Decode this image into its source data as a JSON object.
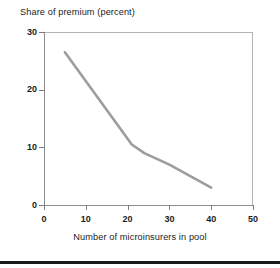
{
  "chart_data": {
    "type": "line",
    "title": "",
    "xlabel": "Number of microinsurers in pool",
    "ylabel": "Share of premium (percent)",
    "xlim": [
      0,
      50
    ],
    "ylim": [
      0,
      30
    ],
    "xticks": [
      0,
      10,
      20,
      30,
      40,
      50
    ],
    "yticks": [
      0,
      10,
      20,
      30
    ],
    "grid": false,
    "legend": null,
    "series": [
      {
        "name": "Share of premium",
        "color": "#9d9d9d",
        "x": [
          5,
          21,
          24,
          30,
          40
        ],
        "values": [
          26.5,
          10.5,
          9.0,
          7.0,
          3.0
        ]
      }
    ]
  },
  "axis": {
    "y_title": "Share of premium (percent)",
    "x_title": "Number of microinsurers in pool",
    "y_tick_labels": [
      "30",
      "20",
      "10",
      "0"
    ],
    "x_tick_labels": [
      "0",
      "10",
      "20",
      "30",
      "40",
      "50"
    ]
  },
  "colors": {
    "line": "#9d9d9d",
    "axis": "#8e8e8e",
    "frame": "#b4b4b4",
    "text": "#1c1c1c",
    "rule": "#1a1a1a",
    "background": "#ffffff"
  }
}
